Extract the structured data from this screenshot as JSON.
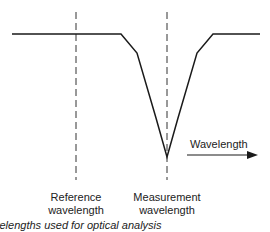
{
  "diagram": {
    "axis_label": "Wavelength",
    "reference_label_line1": "Reference",
    "reference_label_line2": "wavelength",
    "measurement_label_line1": "Measurement",
    "measurement_label_line2": "wavelength",
    "caption": "velengths used for optical analysis",
    "line_color": "#1a1a1a"
  }
}
